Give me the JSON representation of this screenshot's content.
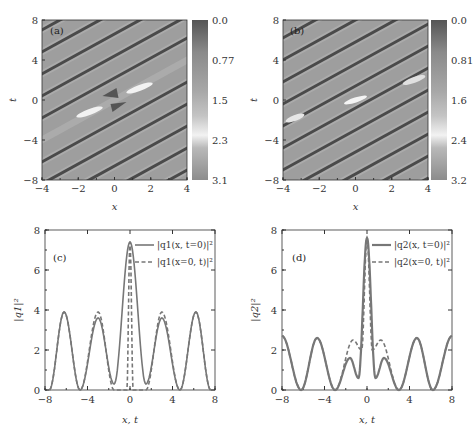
{
  "figure": {
    "panels": [
      "(a)",
      "(b)",
      "(c)",
      "(d)"
    ]
  },
  "chart_data": [
    {
      "type": "heatmap",
      "panel_label": "(a)",
      "xlabel": "x",
      "ylabel": "t",
      "xlim": [
        -4,
        4
      ],
      "ylim": [
        -8,
        8
      ],
      "xticks": [
        "−4",
        "−2",
        "0",
        "2",
        "4"
      ],
      "yticks": [
        "8",
        "4",
        "0",
        "−4",
        "−8"
      ],
      "colorbar": {
        "ticks": [
          "0.0",
          "0.77",
          "1.5",
          "2.3",
          "3.1"
        ],
        "range": [
          0.0,
          3.1
        ]
      },
      "description": "Periodic diagonal dark stripes with a localized peak near origin"
    },
    {
      "type": "heatmap",
      "panel_label": "(b)",
      "xlabel": "x",
      "ylabel": "t",
      "xlim": [
        -4,
        4
      ],
      "ylim": [
        -8,
        8
      ],
      "xticks": [
        "−4",
        "−2",
        "0",
        "2",
        "4"
      ],
      "yticks": [
        "8",
        "4",
        "0",
        "−4",
        "−8"
      ],
      "colorbar": {
        "ticks": [
          "0.0",
          "0.81",
          "1.6",
          "2.4",
          "3.2"
        ],
        "range": [
          0.0,
          3.2
        ]
      },
      "description": "Periodic diagonal dark stripes with a localized peak near origin"
    },
    {
      "type": "line",
      "panel_label": "(c)",
      "xlabel": "x, t",
      "ylabel": "|q1|²",
      "xlim": [
        -8,
        8
      ],
      "ylim": [
        0,
        8
      ],
      "xticks": [
        "−8",
        "−4",
        "0",
        "4",
        "8"
      ],
      "yticks": [
        "0",
        "2",
        "4",
        "6",
        "8"
      ],
      "legend": [
        "|q1(x, t=0)|²",
        "|q1(x=0, t)|²"
      ],
      "series": [
        {
          "name": "|q1(x, t=0)|²",
          "style": "solid",
          "x": [
            -7.6,
            -6.2,
            -4.7,
            -3.0,
            -1.5,
            0,
            1.5,
            3.0,
            4.7,
            6.2,
            7.6
          ],
          "y": [
            0,
            3.9,
            0,
            3.6,
            0.3,
            7.4,
            0.3,
            3.6,
            0,
            3.9,
            0
          ]
        },
        {
          "name": "|q1(x=0, t)|²",
          "style": "dashed",
          "x": [
            -7.6,
            -6.2,
            -4.7,
            -3.0,
            -1.5,
            -0.3,
            0,
            0.3,
            1.5,
            3.0,
            4.7,
            6.2,
            7.6
          ],
          "y": [
            0,
            3.9,
            0,
            3.9,
            0,
            0,
            7.4,
            0,
            0,
            3.9,
            0,
            3.9,
            0
          ]
        }
      ]
    },
    {
      "type": "line",
      "panel_label": "(d)",
      "xlabel": "x, t",
      "ylabel": "|q2|²",
      "xlim": [
        -8,
        8
      ],
      "ylim": [
        0,
        8
      ],
      "xticks": [
        "−8",
        "−4",
        "0",
        "4",
        "8"
      ],
      "yticks": [
        "0",
        "2",
        "4",
        "6",
        "8"
      ],
      "legend": [
        "|q2(x, t=0)|²",
        "|q2(x=0, t)|²"
      ],
      "series": [
        {
          "name": "|q2(x, t=0)|²",
          "style": "solid",
          "x": [
            -8,
            -6.2,
            -4.7,
            -3.0,
            -1.6,
            -0.8,
            0,
            0.8,
            1.6,
            3.0,
            4.7,
            6.2,
            8
          ],
          "y": [
            2.7,
            0,
            2.6,
            0,
            1.6,
            0.6,
            7.6,
            0.6,
            1.6,
            0,
            2.6,
            0,
            2.7
          ]
        },
        {
          "name": "|q2(x=0, t)|²",
          "style": "dashed",
          "x": [
            -8,
            -6.2,
            -4.7,
            -3.0,
            -1.3,
            -0.5,
            0,
            0.5,
            1.3,
            3.0,
            4.7,
            6.2,
            8
          ],
          "y": [
            2.7,
            0,
            2.6,
            0,
            2.5,
            2.0,
            7.6,
            2.0,
            2.5,
            0,
            2.6,
            0,
            2.7
          ]
        }
      ]
    }
  ]
}
